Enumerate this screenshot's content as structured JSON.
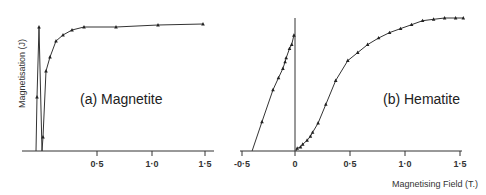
{
  "chart_data": [
    {
      "type": "line",
      "title": "(a) Magnetite",
      "xlabel": "Magnetising Field (T.)",
      "ylabel": "Magnetisation (J)",
      "xlim": [
        -0.05,
        1.55
      ],
      "ylim": [
        0,
        1
      ],
      "grid": false,
      "x_ticks": [
        "0·5",
        "1·0",
        "1·5"
      ],
      "marker": "triangle",
      "series": [
        {
          "name": "Magnetite",
          "x": [
            -0.006,
            -0.004,
            0.0,
            0.006,
            0.02,
            0.04,
            0.07,
            0.11,
            0.17,
            0.24,
            0.38,
            0.67,
            1.07,
            1.48
          ],
          "y": [
            0.0,
            0.41,
            0.93,
            0.0,
            0.1,
            0.6,
            0.71,
            0.83,
            0.87,
            0.9,
            0.93,
            0.93,
            0.95,
            0.95
          ]
        }
      ],
      "pixel_points": [
        [
          36,
          151
        ],
        [
          37,
          97
        ],
        [
          39,
          27
        ],
        [
          42,
          151
        ],
        [
          43,
          137
        ],
        [
          46,
          71
        ],
        [
          50,
          57
        ],
        [
          56,
          41
        ],
        [
          63,
          35
        ],
        [
          72,
          30
        ],
        [
          84,
          27
        ],
        [
          116,
          27
        ],
        [
          158,
          25
        ],
        [
          203,
          24
        ]
      ]
    },
    {
      "type": "line",
      "title": "(b) Hematite",
      "xlabel": "Magnetising Field (T.)",
      "ylabel": "Magnetisation (J)",
      "xlim": [
        -0.5,
        1.5
      ],
      "ylim": [
        0,
        1
      ],
      "grid": false,
      "x_ticks": [
        "-0·5",
        "0",
        "0·5",
        "1·0",
        "1·5"
      ],
      "marker": "triangle",
      "series": [
        {
          "name": "Hematite (negative field)",
          "x": [
            -0.39,
            -0.3,
            -0.2,
            -0.15,
            -0.11,
            -0.09,
            -0.08,
            -0.05,
            -0.03,
            -0.01
          ],
          "y": [
            0.0,
            0.22,
            0.46,
            0.55,
            0.62,
            0.67,
            0.7,
            0.77,
            0.8,
            0.87
          ]
        },
        {
          "name": "Hematite (positive field)",
          "x": [
            0.02,
            0.05,
            0.07,
            0.11,
            0.14,
            0.16,
            0.21,
            0.28,
            0.37,
            0.48,
            0.57,
            0.66,
            0.76,
            0.86,
            0.96,
            1.06,
            1.16,
            1.26,
            1.36,
            1.46,
            1.53
          ],
          "y": [
            0.02,
            0.03,
            0.05,
            0.08,
            0.11,
            0.14,
            0.21,
            0.35,
            0.53,
            0.68,
            0.74,
            0.8,
            0.85,
            0.89,
            0.92,
            0.95,
            0.98,
            0.99,
            1.0,
            1.0,
            1.0
          ]
        }
      ]
    }
  ],
  "panels": {
    "a": {
      "label": "(a) Magnetite",
      "ylabel": "Magnetisation (J)",
      "ticks": [
        {
          "x": 97,
          "label": "0·5"
        },
        {
          "x": 152,
          "label": "1·0"
        },
        {
          "x": 205,
          "label": "1·5"
        }
      ]
    },
    "b": {
      "label": "(b) Hematite",
      "ticks": [
        {
          "x": 242,
          "label": "-0·5"
        },
        {
          "x": 295,
          "label": "0"
        },
        {
          "x": 350,
          "label": "0·5"
        },
        {
          "x": 405,
          "label": "1·0"
        },
        {
          "x": 460,
          "label": "1·5"
        }
      ]
    }
  },
  "xlabel": "Magnetising Field (T.)",
  "colors": {
    "ink": "#222222",
    "background": "#ffffff"
  }
}
